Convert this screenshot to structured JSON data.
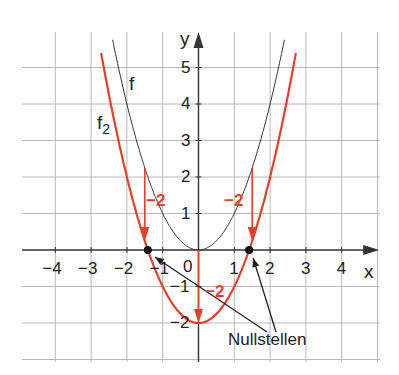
{
  "chart_data": {
    "type": "line",
    "title": "",
    "xlabel": "x",
    "ylabel": "y",
    "xlim": [
      -4.9,
      5.0
    ],
    "ylim": [
      -3.0,
      6.0
    ],
    "grid": true,
    "x_ticks": [
      "−4",
      "−3",
      "−2",
      "−1",
      "0",
      "1",
      "2",
      "3",
      "4"
    ],
    "y_ticks": [
      "5",
      "4",
      "3",
      "2",
      "1",
      "−1",
      "−2"
    ],
    "series": [
      {
        "name": "f",
        "formula": "x^2",
        "color": "#333333",
        "x_range": [
          -2.4,
          2.4
        ]
      },
      {
        "name": "f2",
        "formula": "x^2 - 2",
        "color": "#e5412a",
        "x_range": [
          -2.7,
          2.7
        ]
      }
    ],
    "annotations": [
      {
        "type": "shift-arrow",
        "label": "−2",
        "x": -1.5,
        "from_y": 2.25,
        "to_y": 0.25
      },
      {
        "type": "shift-arrow",
        "label": "−2",
        "x": 0,
        "from_y": 0,
        "to_y": -2
      },
      {
        "type": "shift-arrow",
        "label": "−2",
        "x": 1.5,
        "from_y": 2.25,
        "to_y": 0.25
      },
      {
        "type": "point",
        "label": "Nullstelle",
        "x": -1.414,
        "y": 0
      },
      {
        "type": "point",
        "label": "Nullstelle",
        "x": 1.414,
        "y": 0
      }
    ],
    "legend": [
      "f",
      "f2"
    ]
  },
  "labels": {
    "x_axis": "x",
    "y_axis": "y",
    "curve_f": "f",
    "curve_f2_main": "f",
    "curve_f2_sub": "2",
    "shift_left": "−2",
    "shift_center": "−2",
    "shift_right": "−2",
    "roots_label": "Nullstellen",
    "origin": "0"
  },
  "colors": {
    "grid": "#b8b8b8",
    "axis": "#333333",
    "f": "#333333",
    "f2": "#e5412a"
  }
}
